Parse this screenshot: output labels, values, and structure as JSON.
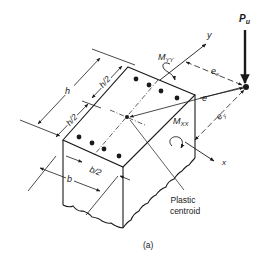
{
  "figure": {
    "caption": "(a)",
    "load": {
      "label": "P",
      "subscript": "u"
    },
    "moments": {
      "myy": {
        "label": "M",
        "subscript": "YY"
      },
      "mxx": {
        "label": "M",
        "subscript": "XX"
      }
    },
    "eccentricities": {
      "e": "e",
      "ex": {
        "label": "e",
        "subscript": "x"
      },
      "ey": {
        "label": "e",
        "subscript": "y"
      }
    },
    "axes": {
      "x": "x",
      "y": "y"
    },
    "dimensions": {
      "h": "h",
      "h_half_1": "h/2",
      "h_half_2": "h/2",
      "b": "b",
      "b_half": "b/2"
    },
    "annotation": {
      "line1": "Plastic",
      "line2": "centroid"
    },
    "colors": {
      "ink": "#1a1a1a",
      "background": "#ffffff"
    }
  }
}
